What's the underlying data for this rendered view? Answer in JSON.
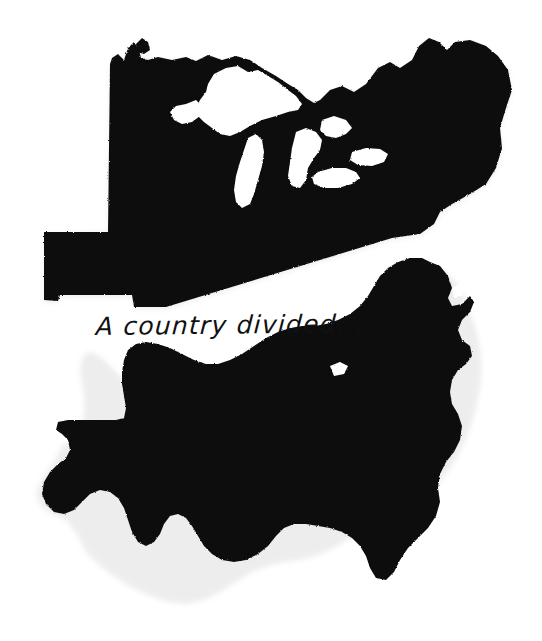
{
  "poster": {
    "background_color": "#ffffff",
    "ink_color": "#111111",
    "shadow_color": "#c9c9c9",
    "caption": "A country divided. . .",
    "pieces": [
      {
        "name": "northern-united-states-cutout",
        "label": "Northern United States",
        "description": "Black paper cutout of the northern half of the contiguous United States, cut away along a diagonal slice; Great Lakes appear as white negative space."
      },
      {
        "name": "southern-united-states-cutout",
        "label": "Southern United States",
        "description": "Black paper cutout of the southern half of the contiguous United States including Texas, the Gulf coast and the Florida peninsula."
      }
    ],
    "negative_spaces": [
      "Lake Superior",
      "Lake Michigan",
      "Lake Huron",
      "Lake Erie",
      "Lake Ontario"
    ]
  }
}
